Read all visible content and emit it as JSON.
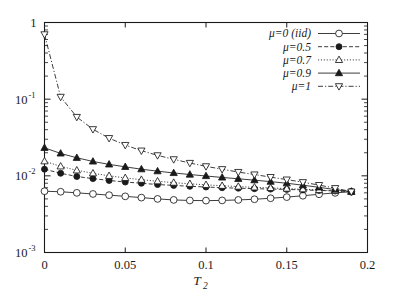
{
  "chart_data": {
    "type": "line",
    "title": "",
    "subtitle": "",
    "xlabel": "T_2",
    "xlabel_base": "T",
    "xlabel_sub": "2",
    "ylabel": "",
    "xlim": [
      0,
      0.2
    ],
    "ylim": [
      0.001,
      1
    ],
    "yscale": "log",
    "xscale": "linear",
    "grid": false,
    "legend_position": "top-right",
    "xticks": [
      0,
      0.05,
      0.1,
      0.15,
      0.2
    ],
    "xtick_labels": [
      "0",
      "0.05",
      "0.1",
      "0.15",
      "0.2"
    ],
    "yticks": [
      0.001,
      0.01,
      0.1,
      1
    ],
    "ytick_labels": [
      "10-3",
      "10-2",
      "10-1",
      "1"
    ],
    "ytick_label_parts": [
      {
        "base": "10",
        "exp": "-3"
      },
      {
        "base": "10",
        "exp": "-2"
      },
      {
        "base": "10",
        "exp": "-1"
      },
      {
        "base": "1",
        "exp": ""
      }
    ],
    "x": [
      0,
      0.01,
      0.02,
      0.03,
      0.04,
      0.05,
      0.06,
      0.07,
      0.08,
      0.09,
      0.1,
      0.11,
      0.12,
      0.13,
      0.14,
      0.15,
      0.16,
      0.17,
      0.18,
      0.19
    ],
    "series": [
      {
        "name": "mu=0 (iid)",
        "label_mu": "μ",
        "label_rest": "=0 (iid)",
        "marker": "open-circle",
        "linestyle": "solid",
        "color": "#1a1a1a",
        "values": [
          0.0063,
          0.0062,
          0.006,
          0.0058,
          0.0056,
          0.0054,
          0.0052,
          0.005,
          0.00485,
          0.00477,
          0.00475,
          0.00478,
          0.00485,
          0.00495,
          0.0051,
          0.00528,
          0.0055,
          0.00575,
          0.006,
          0.0062
        ]
      },
      {
        "name": "mu=0.5",
        "label_mu": "μ",
        "label_rest": "=0.5",
        "marker": "filled-circle",
        "linestyle": "dashed",
        "color": "#1a1a1a",
        "values": [
          0.0122,
          0.0108,
          0.0098,
          0.0092,
          0.0087,
          0.0083,
          0.008,
          0.0077,
          0.0075,
          0.0073,
          0.00715,
          0.007,
          0.0069,
          0.0068,
          0.00672,
          0.00665,
          0.00655,
          0.00645,
          0.00635,
          0.00622
        ]
      },
      {
        "name": "mu=0.7",
        "label_mu": "μ",
        "label_rest": "=0.7",
        "marker": "open-triangle-up",
        "linestyle": "dotted",
        "color": "#1a1a1a",
        "values": [
          0.0155,
          0.0133,
          0.0118,
          0.0108,
          0.01,
          0.0094,
          0.0089,
          0.0085,
          0.00815,
          0.00787,
          0.00763,
          0.00742,
          0.00724,
          0.00708,
          0.00695,
          0.00682,
          0.00668,
          0.00653,
          0.00638,
          0.00622
        ]
      },
      {
        "name": "mu=0.9",
        "label_mu": "μ",
        "label_rest": "=0.9",
        "marker": "filled-triangle-up",
        "linestyle": "solid",
        "color": "#1a1a1a",
        "values": [
          0.0232,
          0.0196,
          0.0172,
          0.0154,
          0.0141,
          0.0131,
          0.0122,
          0.0115,
          0.0109,
          0.0104,
          0.00995,
          0.00953,
          0.00915,
          0.00878,
          0.0084,
          0.008,
          0.00755,
          0.00708,
          0.00662,
          0.00622
        ]
      },
      {
        "name": "mu=1",
        "label_mu": "μ",
        "label_rest": "=1",
        "marker": "open-triangle-down",
        "linestyle": "dashdot",
        "color": "#1a1a1a",
        "values": [
          0.7,
          0.107,
          0.0585,
          0.0405,
          0.031,
          0.0252,
          0.0213,
          0.0185,
          0.0164,
          0.0147,
          0.0133,
          0.0122,
          0.0112,
          0.0104,
          0.00962,
          0.00893,
          0.00825,
          0.00757,
          0.0069,
          0.00622
        ]
      }
    ]
  }
}
